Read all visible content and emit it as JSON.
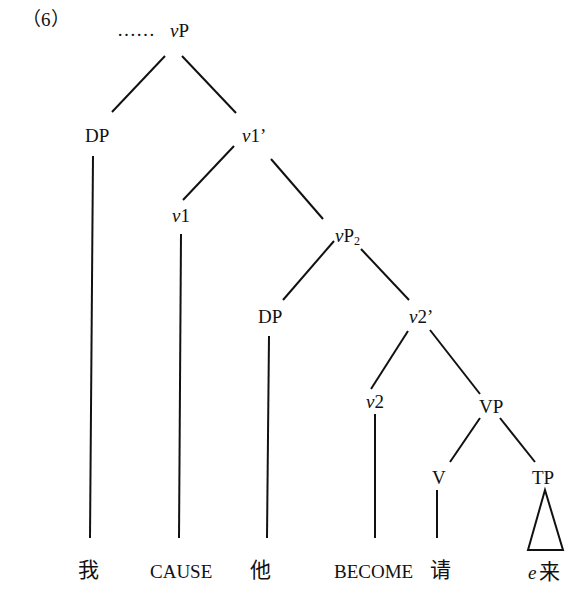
{
  "example_number": "（6）",
  "ellipsis": "……",
  "nodes": {
    "root": {
      "v": "v",
      "rest": "P"
    },
    "dp1": "DP",
    "v1bar": {
      "v": "v",
      "rest": "1’"
    },
    "v1": {
      "v": "v",
      "rest": "1"
    },
    "vp2": {
      "v": "v",
      "rest": "P",
      "sub": "2"
    },
    "dp2": "DP",
    "v2bar": {
      "v": "v",
      "rest": "2’"
    },
    "v2": {
      "v": "v",
      "rest": "2"
    },
    "vp": "VP",
    "verb": "V",
    "tp": "TP"
  },
  "leaves": {
    "wo": "我",
    "cause": "CAUSE",
    "ta": "他",
    "become": "BECOME",
    "qing": "请",
    "e": "e",
    "lai": "来"
  }
}
